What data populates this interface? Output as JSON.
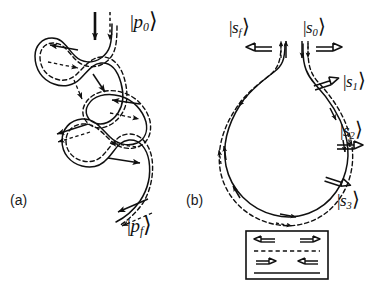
{
  "figure": {
    "background_color": "#ffffff",
    "stroke_color": "#101010",
    "width": 391,
    "height": 285
  },
  "panels": [
    {
      "id": "panel-a",
      "label": "(a)",
      "description": "serpentine trajectory with three loops",
      "kets": [
        {
          "id": "p0",
          "bar": "|",
          "symbol": "p",
          "subscript": "0",
          "angle": "⟩",
          "text": "|p₀⟩"
        },
        {
          "id": "pf",
          "bar": "|",
          "symbol": "p",
          "subscript": "f",
          "angle": "⟩",
          "text": "|p_f⟩"
        }
      ]
    },
    {
      "id": "panel-b",
      "label": "(b)",
      "description": "teardrop loop trajectory with labeled states",
      "kets": [
        {
          "id": "sf",
          "bar": "|",
          "symbol": "s",
          "subscript": "f",
          "angle": "⟩",
          "text": "|s_f⟩"
        },
        {
          "id": "s0",
          "bar": "|",
          "symbol": "s",
          "subscript": "0",
          "angle": "⟩",
          "text": "|s₀⟩"
        },
        {
          "id": "s1",
          "bar": "|",
          "symbol": "s",
          "subscript": "1",
          "angle": "⟩",
          "text": "|s₁⟩"
        },
        {
          "id": "s2",
          "bar": "|",
          "symbol": "s",
          "subscript": "2",
          "angle": "⟩",
          "text": "|s₂⟩"
        },
        {
          "id": "s3",
          "bar": "|",
          "symbol": "s",
          "subscript": "3",
          "angle": "⟩",
          "text": "|s₃⟩"
        }
      ],
      "hollow_arrows": [
        {
          "id": "sf-arrow",
          "direction": "left"
        },
        {
          "id": "s0-arrow",
          "direction": "right"
        },
        {
          "id": "s1-arrow",
          "direction": "right"
        },
        {
          "id": "s2-arrow",
          "direction": "right"
        },
        {
          "id": "s3-arrow",
          "direction": "right"
        }
      ]
    }
  ],
  "legend": {
    "id": "legend-box",
    "rows": [
      {
        "id": "legend-row-dashed",
        "line_style": "dashed",
        "left_arrow": "left",
        "right_arrow": "right"
      },
      {
        "id": "legend-row-solid",
        "line_style": "solid",
        "left_arrow": "right",
        "right_arrow": "left"
      }
    ]
  }
}
